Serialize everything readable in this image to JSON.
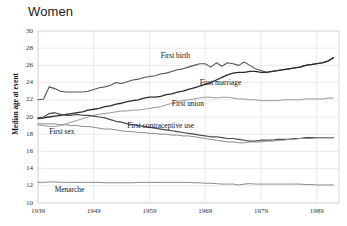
{
  "chart_data": {
    "type": "line",
    "title": "Women",
    "xlabel": "",
    "ylabel": "Median age at event",
    "xlim": [
      1939,
      1993
    ],
    "ylim": [
      10,
      30
    ],
    "ytick_labels": [
      "30",
      "28",
      "26",
      "24",
      "22",
      "20",
      "18",
      "16",
      "14",
      "12",
      "10"
    ],
    "yticks": [
      30,
      28,
      26,
      24,
      22,
      20,
      18,
      16,
      14,
      12,
      10
    ],
    "xtick_labels": [
      "1939",
      "1949",
      "1959",
      "1969",
      "1979",
      "1989"
    ],
    "xticks": [
      1939,
      1949,
      1959,
      1969,
      1979,
      1989
    ],
    "grid": true,
    "legend_position": "inline-annotations",
    "x": [
      1939,
      1940,
      1941,
      1942,
      1943,
      1944,
      1945,
      1946,
      1947,
      1948,
      1949,
      1950,
      1951,
      1952,
      1953,
      1954,
      1955,
      1956,
      1957,
      1958,
      1959,
      1960,
      1961,
      1962,
      1963,
      1964,
      1965,
      1966,
      1967,
      1968,
      1969,
      1970,
      1971,
      1972,
      1973,
      1974,
      1975,
      1976,
      1977,
      1978,
      1979,
      1980,
      1981,
      1982,
      1983,
      1984,
      1985,
      1986,
      1987,
      1988,
      1989,
      1990,
      1991,
      1992
    ],
    "series": [
      {
        "name": "First birth",
        "color": "#555555",
        "width": 1.1,
        "label_x": 1961,
        "label_y": 27.1,
        "values": [
          22.0,
          22.1,
          23.5,
          23.3,
          23.0,
          22.9,
          22.9,
          22.9,
          22.9,
          23.0,
          23.2,
          23.4,
          23.5,
          23.7,
          24.0,
          23.9,
          24.1,
          24.3,
          24.4,
          24.6,
          24.7,
          24.8,
          25.0,
          25.1,
          25.3,
          25.5,
          25.6,
          25.8,
          26.0,
          26.2,
          26.2,
          25.8,
          26.3,
          25.9,
          26.3,
          26.2,
          26.0,
          26.4,
          26.0,
          25.6,
          25.4,
          25.2,
          25.3,
          25.4,
          25.5,
          25.6,
          25.7,
          25.8,
          26.0,
          26.1,
          26.2,
          26.3,
          26.5,
          26.9
        ]
      },
      {
        "name": "First marriage",
        "color": "#2b2b2b",
        "width": 1.3,
        "label_x": 1968,
        "label_y": 24.0,
        "values": [
          19.8,
          19.9,
          20.0,
          20.1,
          20.2,
          20.3,
          20.4,
          20.5,
          20.6,
          20.8,
          20.9,
          21.0,
          21.2,
          21.3,
          21.5,
          21.6,
          21.8,
          21.9,
          22.0,
          22.2,
          22.3,
          22.3,
          22.4,
          22.6,
          22.7,
          22.9,
          23.0,
          23.2,
          23.4,
          23.6,
          23.8,
          24.0,
          24.3,
          24.6,
          24.9,
          25.1,
          25.2,
          25.2,
          25.3,
          25.3,
          25.2,
          25.2,
          25.3,
          25.4,
          25.5,
          25.6,
          25.7,
          25.8,
          26.0,
          26.1,
          26.2,
          26.3,
          26.5,
          26.9
        ]
      },
      {
        "name": "First union",
        "color": "#999999",
        "width": 1.0,
        "label_x": 1963,
        "label_y": 21.5,
        "values": [
          19.1,
          19.0,
          18.9,
          18.9,
          19.0,
          19.2,
          19.4,
          19.6,
          19.8,
          20.0,
          20.2,
          20.3,
          20.4,
          20.5,
          20.6,
          20.7,
          20.7,
          20.8,
          20.8,
          20.9,
          21.0,
          21.1,
          21.2,
          21.4,
          21.6,
          21.8,
          21.9,
          22.0,
          22.1,
          22.2,
          22.3,
          22.3,
          22.2,
          22.3,
          22.3,
          22.2,
          22.1,
          22.1,
          22.0,
          22.0,
          21.9,
          21.9,
          21.9,
          21.9,
          22.0,
          22.0,
          22.0,
          22.0,
          22.1,
          22.1,
          22.1,
          22.1,
          22.2,
          22.2
        ]
      },
      {
        "name": "First sex",
        "color": "#4a4a4a",
        "width": 1.2,
        "label_x": 1941,
        "label_y": 18.3,
        "values": [
          19.9,
          20.0,
          20.4,
          20.5,
          20.3,
          20.2,
          20.2,
          20.3,
          20.2,
          20.2,
          20.1,
          20.0,
          19.9,
          19.7,
          19.5,
          19.4,
          19.2,
          19.1,
          19.0,
          18.9,
          18.8,
          18.7,
          18.6,
          18.5,
          18.4,
          18.3,
          18.2,
          18.1,
          18.0,
          17.9,
          17.8,
          17.7,
          17.7,
          17.6,
          17.5,
          17.5,
          17.4,
          17.3,
          17.2,
          17.2,
          17.3,
          17.3,
          17.3,
          17.4,
          17.4,
          17.4,
          17.5,
          17.5,
          17.6,
          17.6,
          17.6,
          17.6,
          17.6,
          17.6
        ]
      },
      {
        "name": "First contraceptive use",
        "color": "#8a8a8a",
        "width": 1.0,
        "label_x": 1955,
        "label_y": 19.0,
        "values": [
          19.2,
          19.2,
          19.2,
          19.2,
          19.1,
          19.1,
          19.0,
          19.0,
          18.9,
          18.9,
          18.8,
          18.7,
          18.6,
          18.6,
          18.5,
          18.4,
          18.3,
          18.3,
          18.2,
          18.2,
          18.1,
          18.1,
          18.0,
          18.0,
          17.9,
          17.9,
          17.8,
          17.8,
          17.7,
          17.6,
          17.5,
          17.4,
          17.3,
          17.2,
          17.1,
          17.1,
          17.0,
          17.0,
          17.1,
          17.1,
          17.1,
          17.2,
          17.2,
          17.3,
          17.3,
          17.4,
          17.4,
          17.5,
          17.5,
          17.5,
          17.6,
          17.6,
          17.6,
          17.6
        ]
      },
      {
        "name": "Menarche",
        "color": "#8a8a8a",
        "width": 1.0,
        "label_x": 1942,
        "label_y": 11.5,
        "values": [
          12.4,
          12.4,
          12.45,
          12.45,
          12.4,
          12.4,
          12.4,
          12.4,
          12.4,
          12.4,
          12.4,
          12.4,
          12.35,
          12.35,
          12.35,
          12.35,
          12.35,
          12.35,
          12.4,
          12.4,
          12.4,
          12.4,
          12.4,
          12.4,
          12.4,
          12.4,
          12.4,
          12.4,
          12.35,
          12.35,
          12.3,
          12.3,
          12.25,
          12.2,
          12.2,
          12.2,
          12.1,
          12.2,
          12.25,
          12.2,
          12.2,
          12.2,
          12.2,
          12.2,
          12.2,
          12.2,
          12.2,
          12.2,
          12.15,
          12.15,
          12.1,
          12.1,
          12.1,
          12.1
        ]
      }
    ]
  }
}
